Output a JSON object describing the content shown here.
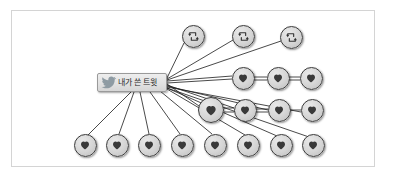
{
  "diagram": {
    "title": "",
    "type": "twitter-propagation-network",
    "background_color": "#ffffff",
    "frame_border_color": "#d4d4d4",
    "node_fill_color": "#d5d5d5",
    "node_border_color": "#3a3a3a",
    "edge_color": "#1c1c1c",
    "source": {
      "label": "내가 쓴 트윗",
      "icon": "twitter-bird-icon",
      "icon_color": "#8e9ba3",
      "x": 132,
      "y": 82.5,
      "width": 70,
      "height": 19
    },
    "nodes": [
      {
        "id": "rt1",
        "icon": "retweet-icon",
        "x": 193,
        "y": 36,
        "r": 11.5
      },
      {
        "id": "rt2",
        "icon": "retweet-icon",
        "x": 243,
        "y": 36,
        "r": 11.5
      },
      {
        "id": "rt3",
        "icon": "retweet-icon",
        "x": 291,
        "y": 37,
        "r": 11.5
      },
      {
        "id": "h1",
        "icon": "heart-icon",
        "x": 243,
        "y": 78,
        "r": 11.5
      },
      {
        "id": "h2",
        "icon": "heart-icon",
        "x": 278,
        "y": 78,
        "r": 11.5
      },
      {
        "id": "h3",
        "icon": "heart-icon",
        "x": 311,
        "y": 78,
        "r": 11.5
      },
      {
        "id": "h4",
        "icon": "heart-icon",
        "x": 211,
        "y": 110,
        "r": 13
      },
      {
        "id": "h5",
        "icon": "heart-icon",
        "x": 245,
        "y": 110,
        "r": 11.5
      },
      {
        "id": "h6",
        "icon": "heart-icon",
        "x": 279,
        "y": 110,
        "r": 11.5
      },
      {
        "id": "h7",
        "icon": "heart-icon",
        "x": 312,
        "y": 110,
        "r": 11.5
      },
      {
        "id": "h8",
        "icon": "heart-icon",
        "x": 85,
        "y": 145,
        "r": 11.5
      },
      {
        "id": "h9",
        "icon": "heart-icon",
        "x": 117,
        "y": 145,
        "r": 11.5
      },
      {
        "id": "h10",
        "icon": "heart-icon",
        "x": 149,
        "y": 145,
        "r": 11.5
      },
      {
        "id": "h11",
        "icon": "heart-icon",
        "x": 182,
        "y": 145,
        "r": 11.5
      },
      {
        "id": "h12",
        "icon": "heart-icon",
        "x": 215,
        "y": 145,
        "r": 11.5
      },
      {
        "id": "h13",
        "icon": "heart-icon",
        "x": 248,
        "y": 145,
        "r": 11.5
      },
      {
        "id": "h14",
        "icon": "heart-icon",
        "x": 281,
        "y": 145,
        "r": 11.5
      },
      {
        "id": "h15",
        "icon": "heart-icon",
        "x": 313,
        "y": 145,
        "r": 11.5
      }
    ],
    "edges": [
      {
        "from": "source",
        "to": "rt1"
      },
      {
        "from": "source",
        "to": "rt2"
      },
      {
        "from": "source",
        "to": "rt3"
      },
      {
        "from": "source",
        "to": "h1"
      },
      {
        "from": "source",
        "to": "h4"
      },
      {
        "from": "source",
        "to": "h5"
      },
      {
        "from": "source",
        "to": "h6"
      },
      {
        "from": "source",
        "to": "h7"
      },
      {
        "from": "source",
        "to": "h8"
      },
      {
        "from": "source",
        "to": "h9"
      },
      {
        "from": "source",
        "to": "h10"
      },
      {
        "from": "source",
        "to": "h11"
      },
      {
        "from": "source",
        "to": "h12"
      },
      {
        "from": "source",
        "to": "h13"
      },
      {
        "from": "source",
        "to": "h14"
      },
      {
        "from": "source",
        "to": "h15"
      },
      {
        "from": "h1",
        "to": "h2"
      },
      {
        "from": "h2",
        "to": "h3"
      },
      {
        "from": "h4",
        "to": "h5"
      },
      {
        "from": "h5",
        "to": "h6"
      },
      {
        "from": "h6",
        "to": "h7"
      }
    ],
    "counts": {
      "retweet_nodes": 3,
      "heart_nodes": 15,
      "total_nodes": 18
    }
  }
}
